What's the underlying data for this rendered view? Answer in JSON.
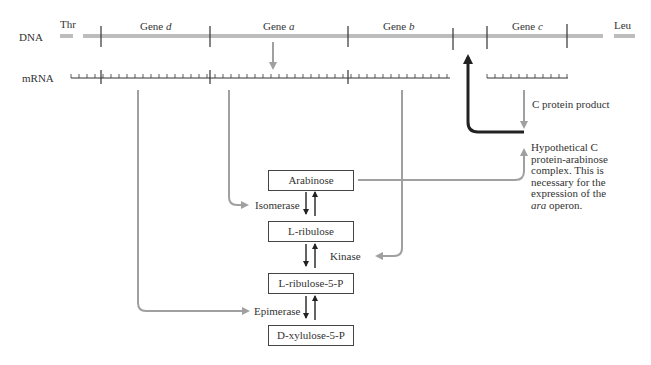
{
  "dna": {
    "label": "DNA",
    "left_marker": "Thr",
    "right_marker": "Leu",
    "genes": [
      {
        "label": "Gene",
        "letter": "d"
      },
      {
        "label": "Gene",
        "letter": "a"
      },
      {
        "label": "Gene",
        "letter": "b"
      },
      {
        "label": "Gene",
        "letter": "c"
      }
    ]
  },
  "mrna": {
    "label": "mRNA"
  },
  "c_protein": {
    "label": "C  protein product"
  },
  "complex_note": {
    "line1": "Hypothetical C",
    "line2": "protein-arabinose",
    "line3": "complex.  This is",
    "line4": "necessary for the",
    "line5": "expression of the",
    "line6_italic": "ara",
    "line6_rest": " operon."
  },
  "pathway": {
    "metabolites": [
      "Arabinose",
      "L-ribulose",
      "L-ribulose-5-P",
      "D-xylulose-5-P"
    ],
    "enzymes": [
      "Isomerase",
      "Kinase",
      "Epimerase"
    ]
  },
  "colors": {
    "gray_arrow": "#a0a0a0",
    "dna_bar": "#bdbdbd",
    "regulatory_arrow": "#222222",
    "text": "#333333"
  }
}
